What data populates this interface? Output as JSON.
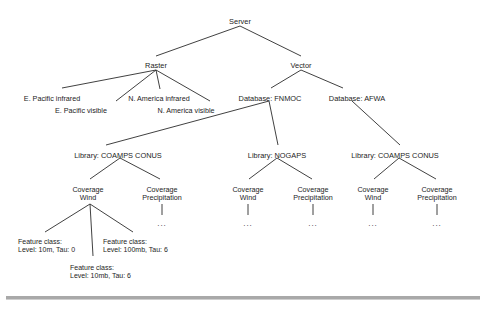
{
  "diagram": {
    "type": "tree",
    "root": {
      "label": "Server",
      "x": 240,
      "y": 18
    },
    "nodes": {
      "raster": {
        "label": "Raster",
        "x": 156,
        "y": 62
      },
      "vector": {
        "label": "Vector",
        "x": 301,
        "y": 62
      },
      "raster_children": [
        {
          "label": "E. Pacific infrared",
          "x": 52,
          "y": 95
        },
        {
          "label": "E. Pacific visible",
          "x": 81,
          "y": 107
        },
        {
          "label": "N. America infrared",
          "x": 159,
          "y": 95
        },
        {
          "label": "N. America visible",
          "x": 186,
          "y": 107
        }
      ],
      "databases": [
        {
          "label": "Database:  FNMOC",
          "x": 270,
          "y": 95
        },
        {
          "label": "Database:  AFWA",
          "x": 357,
          "y": 95
        }
      ],
      "libraries": [
        {
          "label": "Library:  COAMPS CONUS",
          "x": 118,
          "y": 152
        },
        {
          "label": "Library:  NOGAPS",
          "x": 277,
          "y": 152
        },
        {
          "label": "Library:  COAMPS CONUS",
          "x": 395,
          "y": 152
        }
      ],
      "coverages": [
        {
          "line1": "Coverage",
          "line2": "Wind",
          "x": 88,
          "y": 186
        },
        {
          "line1": "Coverage",
          "line2": "Precipitation",
          "x": 162,
          "y": 186
        },
        {
          "line1": "Coverage",
          "line2": "Wind",
          "x": 248,
          "y": 186
        },
        {
          "line1": "Coverage",
          "line2": "Precipitation",
          "x": 313,
          "y": 186
        },
        {
          "line1": "Coverage",
          "line2": "Wind",
          "x": 373,
          "y": 186
        },
        {
          "line1": "Coverage",
          "line2": "Precipitation",
          "x": 437,
          "y": 186
        }
      ],
      "feature_classes": [
        {
          "line1": "Feature class:",
          "line2": "Level: 10m, Tau: 0",
          "x": 18,
          "y": 238
        },
        {
          "line1": "Feature class:",
          "line2": "Level: 100mb, Tau: 6",
          "x": 103,
          "y": 238
        },
        {
          "line1": "Feature class:",
          "line2": "Level: 10mb, Tau: 6",
          "x": 70,
          "y": 264
        }
      ],
      "ellipses": [
        {
          "label": "...",
          "x": 162,
          "y": 219
        },
        {
          "label": "...",
          "x": 248,
          "y": 219
        },
        {
          "label": "...",
          "x": 313,
          "y": 219
        },
        {
          "label": "...",
          "x": 373,
          "y": 219
        },
        {
          "label": "...",
          "x": 437,
          "y": 219
        }
      ]
    },
    "edges": [
      {
        "from": "Server",
        "to": "Raster",
        "x1": 240,
        "y1": 26,
        "x2": 156,
        "y2": 56
      },
      {
        "from": "Server",
        "to": "Vector",
        "x1": 240,
        "y1": 26,
        "x2": 301,
        "y2": 56
      },
      {
        "from": "Raster",
        "to": "E. Pacific infrared",
        "x1": 156,
        "y1": 70,
        "x2": 62,
        "y2": 88
      },
      {
        "from": "Raster",
        "to": "E. Pacific visible",
        "x1": 156,
        "y1": 70,
        "x2": 116,
        "y2": 101
      },
      {
        "from": "Raster",
        "to": "N. America infrared",
        "x1": 156,
        "y1": 70,
        "x2": 160,
        "y2": 89
      },
      {
        "from": "Raster",
        "to": "N. America visible",
        "x1": 156,
        "y1": 70,
        "x2": 210,
        "y2": 101
      },
      {
        "from": "Vector",
        "to": "Database: FNMOC",
        "x1": 301,
        "y1": 70,
        "x2": 271,
        "y2": 88
      },
      {
        "from": "Vector",
        "to": "Database: AFWA",
        "x1": 301,
        "y1": 70,
        "x2": 343,
        "y2": 88
      },
      {
        "from": "Database: FNMOC",
        "to": "Library: COAMPS CONUS",
        "x1": 269,
        "y1": 101,
        "x2": 106,
        "y2": 145
      },
      {
        "from": "Database: FNMOC",
        "to": "Library: NOGAPS",
        "x1": 269,
        "y1": 101,
        "x2": 278,
        "y2": 145
      },
      {
        "from": "Database: AFWA",
        "to": "Library: COAMPS CONUS",
        "x1": 352,
        "y1": 101,
        "x2": 400,
        "y2": 145
      },
      {
        "from": "Library: COAMPS CONUS 1",
        "to": "Coverage Wind 1",
        "x1": 120,
        "y1": 158,
        "x2": 90,
        "y2": 179
      },
      {
        "from": "Library: COAMPS CONUS 1",
        "to": "Coverage Precipitation 1",
        "x1": 120,
        "y1": 158,
        "x2": 160,
        "y2": 179
      },
      {
        "from": "Library: NOGAPS",
        "to": "Coverage Wind 2",
        "x1": 277,
        "y1": 158,
        "x2": 249,
        "y2": 179
      },
      {
        "from": "Library: NOGAPS",
        "to": "Coverage Precipitation 2",
        "x1": 277,
        "y1": 158,
        "x2": 312,
        "y2": 179
      },
      {
        "from": "Library: COAMPS CONUS 2",
        "to": "Coverage Wind 3",
        "x1": 399,
        "y1": 158,
        "x2": 374,
        "y2": 179
      },
      {
        "from": "Library: COAMPS CONUS 2",
        "to": "Coverage Precipitation 3",
        "x1": 399,
        "y1": 158,
        "x2": 436,
        "y2": 179
      },
      {
        "from": "Coverage Wind 1",
        "to": "Feature class 1",
        "x1": 90,
        "y1": 204,
        "x2": 45,
        "y2": 232
      },
      {
        "from": "Coverage Wind 1",
        "to": "Feature class 3",
        "x1": 90,
        "y1": 204,
        "x2": 93,
        "y2": 256
      },
      {
        "from": "Coverage Wind 1",
        "to": "Feature class 2",
        "x1": 90,
        "y1": 204,
        "x2": 133,
        "y2": 232
      },
      {
        "from": "Coverage Precipitation 1",
        "to": "ellipsis 1",
        "x1": 162,
        "y1": 204,
        "x2": 162,
        "y2": 215
      },
      {
        "from": "Coverage Wind 2",
        "to": "ellipsis 2",
        "x1": 248,
        "y1": 204,
        "x2": 248,
        "y2": 215
      },
      {
        "from": "Coverage Precipitation 2",
        "to": "ellipsis 3",
        "x1": 313,
        "y1": 204,
        "x2": 313,
        "y2": 215
      },
      {
        "from": "Coverage Wind 3",
        "to": "ellipsis 4",
        "x1": 373,
        "y1": 204,
        "x2": 373,
        "y2": 215
      },
      {
        "from": "Coverage Precipitation 3",
        "to": "ellipsis 5",
        "x1": 437,
        "y1": 204,
        "x2": 437,
        "y2": 215
      }
    ]
  }
}
